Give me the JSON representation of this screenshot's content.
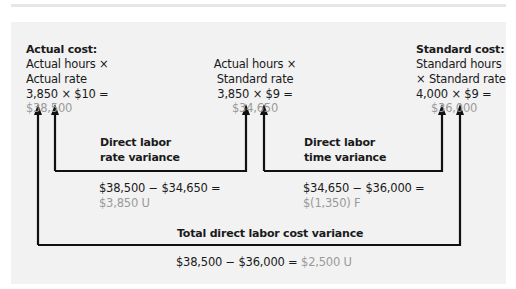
{
  "columns": {
    "actual_cost": {
      "title": "Actual cost:",
      "line1": "Actual hours ×",
      "line2": "Actual rate",
      "calc": "3,850 × $10 =",
      "result": "$38,500"
    },
    "actual_hours_standard_rate": {
      "line1": "Actual hours ×",
      "line2": "Standard rate",
      "calc": "3,850 × $9 =",
      "result": "$34,650"
    },
    "standard_cost": {
      "title": "Standard cost:",
      "line1": "Standard hours",
      "line2": "× Standard rate",
      "calc": "4,000 × $9 =",
      "result": "$36,000"
    }
  },
  "variances": {
    "rate": {
      "title_line1": "Direct labor",
      "title_line2": "rate variance",
      "calc": "$38,500 − $34,650 =",
      "result": "$3,850 U"
    },
    "time": {
      "title_line1": "Direct labor",
      "title_line2": "time variance",
      "calc": "$34,650 − $36,000 =",
      "result": "$(1,350) F"
    },
    "total": {
      "title": "Total direct labor cost variance",
      "calc": "$38,500 − $36,000 =",
      "result": "$2,500 U"
    }
  },
  "colors": {
    "panel_background": "#f2f2f2",
    "result_text": "#9a9a9a",
    "arrow": "#111111"
  }
}
